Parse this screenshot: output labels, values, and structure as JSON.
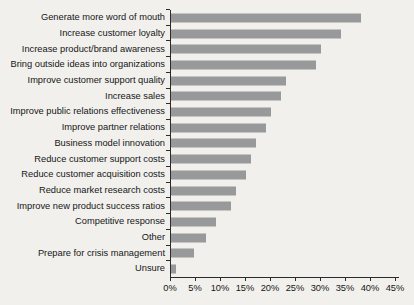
{
  "figure": {
    "background_color": "#f1f0ed",
    "bar_color": "#98999a",
    "axis_color": "#2b2b2b",
    "text_color": "#161616"
  },
  "chart_data": {
    "type": "bar",
    "orientation": "horizontal",
    "title": "",
    "xlabel": "",
    "ylabel": "",
    "grid": false,
    "legend": null,
    "value_unit": "%",
    "categories": [
      "Generate more word of mouth",
      "Increase customer loyalty",
      "Increase product/brand awareness",
      "Bring outside ideas into organizations",
      "Improve customer support quality",
      "Increase sales",
      "Improve public relations effectiveness",
      "Improve partner relations",
      "Business model innovation",
      "Reduce customer support costs",
      "Reduce customer acquisition costs",
      "Reduce market research costs",
      "Improve new product success ratios",
      "Competitive response",
      "Other",
      "Prepare for crisis management",
      "Unsure"
    ],
    "values": [
      38,
      34,
      30,
      29,
      23,
      22,
      20,
      19,
      17,
      16,
      15,
      13,
      12,
      9,
      7,
      4.5,
      1
    ],
    "xlim": [
      0,
      45
    ],
    "xticks": [
      "0%",
      "5%",
      "10%",
      "15%",
      "20%",
      "25%",
      "30%",
      "35%",
      "40%",
      "45%"
    ],
    "xtick_values": [
      0,
      5,
      10,
      15,
      20,
      25,
      30,
      35,
      40,
      45
    ]
  }
}
